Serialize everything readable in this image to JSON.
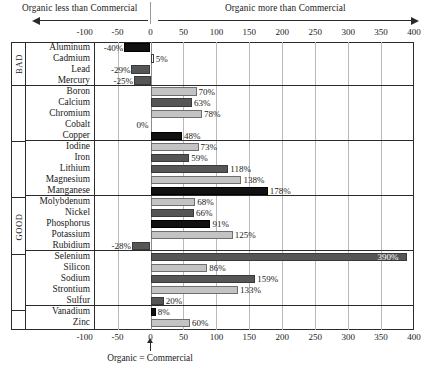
{
  "header": {
    "left_label": "Organic less than Commercial",
    "right_label": "Organic more than Commercial",
    "left_arrow_icon": "arrow-left-icon",
    "right_arrow_icon": "arrow-right-icon"
  },
  "footer": {
    "label": "Organic = Commercial",
    "arrow_icon": "arrow-up-icon"
  },
  "chart_data": {
    "type": "bar",
    "orientation": "horizontal",
    "title": "",
    "subtitle": "",
    "xlabel": "",
    "ylabel": "",
    "xlim": [
      -125,
      400
    ],
    "axis_ticks": [
      -100,
      -50,
      0,
      50,
      100,
      150,
      200,
      250,
      300,
      350,
      400
    ],
    "axis_tick_labels": [
      "-100",
      "-50",
      "0",
      "50",
      "100",
      "150",
      "200",
      "250",
      "300",
      "350",
      "400"
    ],
    "grid": true,
    "grid_axis": "x",
    "legend": "none",
    "annotations": {
      "left_direction": "Organic less than Commercial",
      "right_direction": "Organic more than Commercial",
      "origin": "Organic = Commercial"
    },
    "value_unit": "%",
    "groups": [
      {
        "tag": "BAD",
        "categories": [
          "Aluminum",
          "Cadmium",
          "Lead",
          "Mercury"
        ],
        "values": [
          -40,
          5,
          -29,
          -25
        ],
        "value_labels": [
          "-40%",
          "5%",
          "-29%",
          "-25%"
        ],
        "shades": [
          "dark",
          "white",
          "mid",
          "mid"
        ]
      },
      {
        "tag": "",
        "categories": [
          "Boron",
          "Calcium",
          "Chromium",
          "Cobalt",
          "Copper"
        ],
        "values": [
          70,
          63,
          78,
          0,
          48
        ],
        "value_labels": [
          "70%",
          "63%",
          "78%",
          "0%",
          "48%"
        ],
        "shades": [
          "light",
          "mid",
          "light",
          "none",
          "dark"
        ]
      },
      {
        "tag": "",
        "categories": [
          "Iodine",
          "Iron",
          "Lithium",
          "Magnesium",
          "Manganese"
        ],
        "values": [
          73,
          59,
          118,
          138,
          178
        ],
        "value_labels": [
          "73%",
          "59%",
          "118%",
          "138%",
          "178%"
        ],
        "shades": [
          "light",
          "mid",
          "mid",
          "light",
          "dark"
        ]
      },
      {
        "tag": "GOOD",
        "categories": [
          "Molybdenum",
          "Nickel",
          "Phosphorus",
          "Potassium",
          "Rubidium"
        ],
        "values": [
          68,
          66,
          91,
          125,
          -28
        ],
        "value_labels": [
          "68%",
          "66%",
          "91%",
          "125%",
          "-28%"
        ],
        "shades": [
          "light",
          "mid",
          "dark",
          "light",
          "mid"
        ]
      },
      {
        "tag": "",
        "categories": [
          "Selenium",
          "Silicon",
          "Sodium",
          "Strontium",
          "Sulfur"
        ],
        "values": [
          390,
          86,
          159,
          133,
          20
        ],
        "value_labels": [
          "390%",
          "86%",
          "159%",
          "133%",
          "20%"
        ],
        "shades": [
          "mid",
          "light",
          "mid",
          "light",
          "mid"
        ]
      },
      {
        "tag": "",
        "categories": [
          "Vanadium",
          "Zinc"
        ],
        "values": [
          8,
          60
        ],
        "value_labels": [
          "8%",
          "60%"
        ],
        "shades": [
          "dark",
          "light"
        ]
      }
    ]
  },
  "colors": {
    "light": "#c3c3c3",
    "mid": "#565656",
    "dark": "#111111",
    "frame": "#2b2b2b",
    "grid": "#b9b9b9",
    "background": "#ffffff"
  }
}
